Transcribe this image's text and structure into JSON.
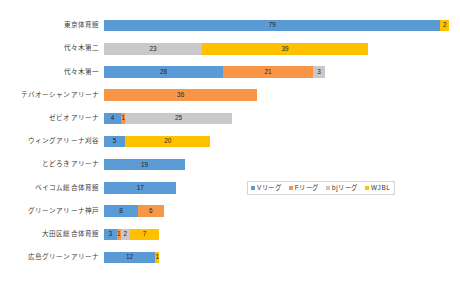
{
  "chart_data": {
    "type": "bar",
    "orientation": "horizontal",
    "stacked": true,
    "title": "",
    "subtitle": "",
    "xlabel": "",
    "ylabel": "",
    "grid": false,
    "xlim": [
      0,
      81
    ],
    "legend_position": "middle-right",
    "categories": [
      "東京体育館",
      "代々木第二",
      "代々木第一",
      "テバオーシャンアリーナ",
      "ゼビオアリーナ",
      "ウィングアリーナ刈谷",
      "とどろきアリーナ",
      "ベイコム総合体育館",
      "グリーンアリーナ神戸",
      "大田区総合体育館",
      "広島グリーンアリーナ"
    ],
    "series": [
      {
        "name": "Vリーグ",
        "color": "#5b9bd5",
        "values": [
          79,
          0,
          28,
          0,
          4,
          5,
          19,
          17,
          8,
          3,
          12
        ]
      },
      {
        "name": "Fリーグ",
        "color": "#f79646",
        "values": [
          0,
          0,
          21,
          36,
          1,
          0,
          0,
          0,
          6,
          1,
          0
        ]
      },
      {
        "name": "bjリーグ",
        "color": "#c9c9c9",
        "values": [
          0,
          23,
          3,
          0,
          25,
          0,
          0,
          0,
          0,
          2,
          0
        ]
      },
      {
        "name": "WJBL",
        "color": "#ffc000",
        "values": [
          2,
          39,
          0,
          0,
          0,
          20,
          0,
          0,
          0,
          7,
          1
        ]
      }
    ],
    "bars": [
      {
        "category": "東京体育館",
        "segments": [
          {
            "series": "Vリーグ",
            "value": 79
          },
          {
            "series": "WJBL",
            "value": 2
          }
        ]
      },
      {
        "category": "代々木第二",
        "segments": [
          {
            "series": "bjリーグ",
            "value": 23
          },
          {
            "series": "WJBL",
            "value": 39
          }
        ]
      },
      {
        "category": "代々木第一",
        "segments": [
          {
            "series": "Vリーグ",
            "value": 28
          },
          {
            "series": "Fリーグ",
            "value": 21
          },
          {
            "series": "bjリーグ",
            "value": 3
          }
        ]
      },
      {
        "category": "テバオーシャンアリーナ",
        "segments": [
          {
            "series": "Fリーグ",
            "value": 36
          }
        ]
      },
      {
        "category": "ゼビオアリーナ",
        "segments": [
          {
            "series": "Vリーグ",
            "value": 4
          },
          {
            "series": "Fリーグ",
            "value": 1
          },
          {
            "series": "bjリーグ",
            "value": 25
          }
        ]
      },
      {
        "category": "ウィングアリーナ刈谷",
        "segments": [
          {
            "series": "Vリーグ",
            "value": 5
          },
          {
            "series": "WJBL",
            "value": 20
          }
        ]
      },
      {
        "category": "とどろきアリーナ",
        "segments": [
          {
            "series": "Vリーグ",
            "value": 19
          }
        ]
      },
      {
        "category": "ベイコム総合体育館",
        "segments": [
          {
            "series": "Vリーグ",
            "value": 17
          }
        ]
      },
      {
        "category": "グリーンアリーナ神戸",
        "segments": [
          {
            "series": "Vリーグ",
            "value": 8
          },
          {
            "series": "Fリーグ",
            "value": 6
          }
        ]
      },
      {
        "category": "大田区総合体育館",
        "segments": [
          {
            "series": "Vリーグ",
            "value": 3
          },
          {
            "series": "Fリーグ",
            "value": 1
          },
          {
            "series": "bjリーグ",
            "value": 2
          },
          {
            "series": "WJBL",
            "value": 7
          }
        ]
      },
      {
        "category": "広島グリーンアリーナ",
        "segments": [
          {
            "series": "Vリーグ",
            "value": 12
          },
          {
            "series": "WJBL",
            "value": 1
          }
        ]
      }
    ]
  },
  "legend": {
    "items": [
      {
        "label": "Vリーグ",
        "color": "#5b9bd5"
      },
      {
        "label": "Fリーグ",
        "color": "#f79646"
      },
      {
        "label": "bjリーグ",
        "color": "#c9c9c9"
      },
      {
        "label": "WJBL",
        "color": "#ffc000"
      }
    ]
  }
}
